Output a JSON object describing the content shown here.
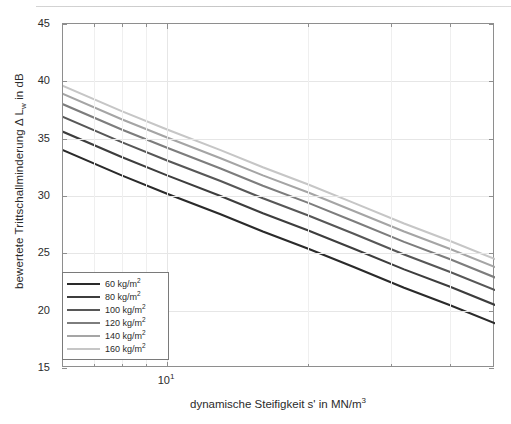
{
  "figure": {
    "background": "#ffffff",
    "axis_color": "#8e8e8e",
    "grid_color": "#e6e6e6"
  },
  "axis_titles": {
    "x_prefix": "dynamische Steifigkeit s' in MN/m",
    "x_sup": "3",
    "y_prefix": "bewertete Trittschallminderung ",
    "y_delta": "Δ",
    "y_mid": " L",
    "y_sub": "w",
    "y_suffix": " in dB"
  },
  "y_axis": {
    "ticks": [
      15,
      20,
      25,
      30,
      35,
      40,
      45
    ],
    "labels": [
      "15",
      "20",
      "25",
      "30",
      "35",
      "40",
      "45"
    ],
    "min": 15,
    "max": 45
  },
  "x_axis": {
    "scale": "log",
    "min": 6.0,
    "max": 50.0,
    "major_ticks": [
      10
    ],
    "major_labels": [
      "10"
    ],
    "major_exponent": "1",
    "minor_ticks": [
      7,
      8,
      9,
      20,
      30,
      40,
      50
    ]
  },
  "legend": {
    "items": [
      {
        "label_prefix": "60 kg/m",
        "label_sup": "2",
        "color": "#2a2a2a"
      },
      {
        "label_prefix": "80 kg/m",
        "label_sup": "2",
        "color": "#3d3d3d"
      },
      {
        "label_prefix": "100 kg/m",
        "label_sup": "2",
        "color": "#575757"
      },
      {
        "label_prefix": "120 kg/m",
        "label_sup": "2",
        "color": "#7d7d7d"
      },
      {
        "label_prefix": "140 kg/m",
        "label_sup": "2",
        "color": "#a5a5a5"
      },
      {
        "label_prefix": "160 kg/m",
        "label_sup": "2",
        "color": "#c6c6c6"
      }
    ]
  },
  "chart_data": {
    "type": "line",
    "title": "",
    "xlabel": "dynamische Steifigkeit s' in MN/m^3",
    "ylabel": "bewertete Trittschallminderung Δ L_w in dB",
    "xscale": "log",
    "xlim": [
      6.0,
      50.0
    ],
    "ylim": [
      15,
      45
    ],
    "grid": true,
    "legend_position": "lower left",
    "x": [
      6.0,
      8.0,
      10.0,
      13.0,
      16.0,
      20.0,
      25.0,
      32.0,
      40.0,
      50.0
    ],
    "series": [
      {
        "name": "60 kg/m^2",
        "color": "#2a2a2a",
        "values": [
          34.0,
          31.8,
          30.2,
          28.4,
          26.9,
          25.4,
          23.8,
          22.0,
          20.5,
          18.9
        ]
      },
      {
        "name": "80 kg/m^2",
        "color": "#3d3d3d",
        "values": [
          35.6,
          33.4,
          31.8,
          30.0,
          28.5,
          27.0,
          25.4,
          23.6,
          22.1,
          20.5
        ]
      },
      {
        "name": "100 kg/m^2",
        "color": "#575757",
        "values": [
          36.9,
          34.7,
          33.1,
          31.3,
          29.8,
          28.3,
          26.7,
          24.9,
          23.4,
          21.8
        ]
      },
      {
        "name": "120 kg/m^2",
        "color": "#7d7d7d",
        "values": [
          38.0,
          35.8,
          34.2,
          32.4,
          30.9,
          29.4,
          27.8,
          26.0,
          24.5,
          22.9
        ]
      },
      {
        "name": "140 kg/m^2",
        "color": "#a5a5a5",
        "values": [
          38.9,
          36.7,
          35.1,
          33.3,
          31.8,
          30.3,
          28.7,
          26.9,
          25.4,
          23.8
        ]
      },
      {
        "name": "160 kg/m^2",
        "color": "#c6c6c6",
        "values": [
          39.6,
          37.4,
          35.8,
          34.0,
          32.5,
          31.0,
          29.4,
          27.6,
          26.1,
          24.5
        ]
      }
    ]
  }
}
